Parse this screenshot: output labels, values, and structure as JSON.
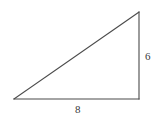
{
  "figure": {
    "name": "right-triangle",
    "canvas": {
      "width": 157,
      "height": 117,
      "background": "#ffffff"
    },
    "stroke": {
      "color": "#4a4a4a",
      "width": 1.1
    },
    "vertices": {
      "bottom_left": {
        "x": 14,
        "y": 99
      },
      "bottom_right": {
        "x": 139,
        "y": 99
      },
      "top_right": {
        "x": 139,
        "y": 12
      }
    },
    "edges": [
      {
        "name": "horizontal-leg",
        "from": "bottom_left",
        "to": "bottom_right",
        "label": "8"
      },
      {
        "name": "vertical-leg",
        "from": "bottom_right",
        "to": "top_right",
        "label": "6"
      },
      {
        "name": "hypotenuse",
        "from": "bottom_left",
        "to": "top_right",
        "label": ""
      }
    ],
    "labels": {
      "vertical_leg": "6",
      "horizontal_leg": "8"
    }
  },
  "chart_data": {
    "type": "diagram",
    "title": "",
    "shape": "right-triangle",
    "categories": [
      "vertical leg",
      "horizontal leg"
    ],
    "values": [
      6,
      8
    ],
    "annotations": [
      {
        "text": "6",
        "position": "right-of-vertical-leg"
      },
      {
        "text": "8",
        "position": "below-horizontal-leg"
      }
    ]
  }
}
